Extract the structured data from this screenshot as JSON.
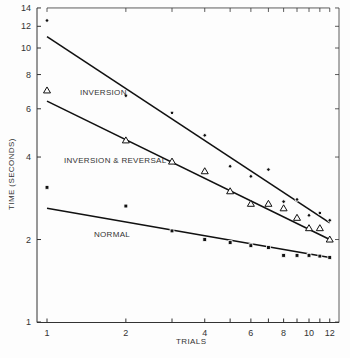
{
  "chart_data": {
    "type": "scatter",
    "title": "",
    "xlabel": "TRIALS",
    "ylabel": "TIME (SECONDS)",
    "xscale": "log",
    "yscale": "log",
    "xlim": [
      1,
      12
    ],
    "ylim": [
      1,
      14
    ],
    "x_ticks": [
      1,
      2,
      4,
      6,
      8,
      10,
      12
    ],
    "x_minor_ticks": [
      3,
      5,
      7,
      9,
      11
    ],
    "y_ticks": [
      1,
      2,
      4,
      6,
      8,
      10,
      12,
      14
    ],
    "grid": false,
    "x": [
      1,
      2,
      3,
      4,
      5,
      6,
      7,
      8,
      9,
      10,
      11,
      12
    ],
    "series": [
      {
        "name": "INVERSION",
        "marker": "dot",
        "values": [
          12.6,
          6.7,
          5.8,
          4.8,
          3.7,
          3.4,
          3.6,
          2.75,
          2.8,
          2.45,
          2.5,
          2.35
        ],
        "fit_line": {
          "x": [
            1,
            12
          ],
          "y": [
            11.0,
            2.3
          ]
        }
      },
      {
        "name": "INVERSION & REVERSAL",
        "marker": "triangle",
        "values": [
          7.0,
          4.6,
          3.85,
          3.55,
          3.0,
          2.7,
          2.7,
          2.6,
          2.4,
          2.2,
          2.2,
          2.0
        ],
        "fit_line": {
          "x": [
            1,
            12
          ],
          "y": [
            6.4,
            2.0
          ]
        }
      },
      {
        "name": "NORMAL",
        "marker": "square",
        "values": [
          3.1,
          2.65,
          2.15,
          2.0,
          1.95,
          1.9,
          1.87,
          1.75,
          1.75,
          1.75,
          1.74,
          1.72
        ],
        "fit_line": {
          "x": [
            1,
            12
          ],
          "y": [
            2.6,
            1.72
          ]
        }
      }
    ],
    "annotations": [
      {
        "text": "INVERSION",
        "near_series": "INVERSION"
      },
      {
        "text": "INVERSION & REVERSAL",
        "near_series": "INVERSION & REVERSAL"
      },
      {
        "text": "NORMAL",
        "near_series": "NORMAL"
      }
    ]
  },
  "labels": {
    "xlabel": "TRIALS",
    "ylabel": "TIME (SECONDS)",
    "inversion": "INVERSION",
    "inv_rev": "INVERSION & REVERSAL",
    "normal": "NORMAL"
  }
}
